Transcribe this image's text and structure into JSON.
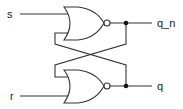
{
  "diagram": {
    "type": "SR latch (cross-coupled NOR gates)",
    "inputs": [
      {
        "label": "s"
      },
      {
        "label": "r"
      }
    ],
    "outputs": [
      {
        "label": "q_n"
      },
      {
        "label": "q"
      }
    ],
    "gates": [
      {
        "type": "NOR",
        "inputs": [
          "s",
          "q"
        ],
        "output": "q_n"
      },
      {
        "type": "NOR",
        "inputs": [
          "r",
          "q_n"
        ],
        "output": "q"
      }
    ],
    "colors": {
      "line": "#333333",
      "background": "#ffffff"
    }
  }
}
